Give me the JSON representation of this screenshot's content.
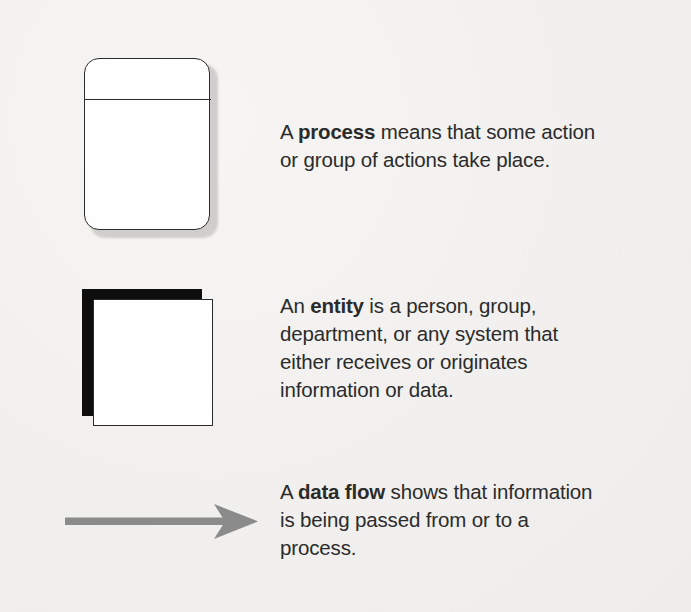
{
  "page": {
    "background_color": "#f2f1ef",
    "text_color": "#2b2b2b"
  },
  "symbols": [
    {
      "id": "process",
      "shape_name": "rounded-rectangle-with-top-band",
      "keyword": "process",
      "stroke_color": "#2c2c2c",
      "fill_color": "#fefefe",
      "shadow_color": "#c9c8c6",
      "description_lines": [
        {
          "pre": "A ",
          "bold": "process",
          "post": " means that some action"
        },
        {
          "pre": "",
          "bold": "",
          "post": "or group of actions take place."
        }
      ]
    },
    {
      "id": "entity",
      "shape_name": "offset-double-square",
      "keyword": "entity",
      "stroke_color": "#2b2b2b",
      "fill_color": "#fefefe",
      "back_color": "#0d0d0d",
      "description_lines": [
        {
          "pre": "An ",
          "bold": "entity",
          "post": " is a person, group,"
        },
        {
          "pre": "",
          "bold": "",
          "post": "department, or any system that"
        },
        {
          "pre": "",
          "bold": "",
          "post": "either receives or originates"
        },
        {
          "pre": "",
          "bold": "",
          "post": "information or data."
        }
      ]
    },
    {
      "id": "data-flow",
      "shape_name": "right-arrow",
      "keyword": "data flow",
      "arrow_color": "#8b8b8b",
      "description_lines": [
        {
          "pre": "A ",
          "bold": "data flow",
          "post": " shows that information"
        },
        {
          "pre": "",
          "bold": "",
          "post": "is being passed from or to a"
        },
        {
          "pre": "",
          "bold": "",
          "post": "process."
        }
      ]
    }
  ]
}
